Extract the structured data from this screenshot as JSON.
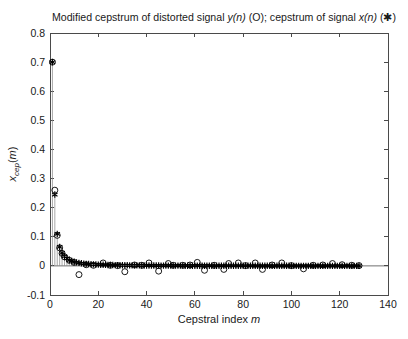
{
  "figure": {
    "background": "#ffffff",
    "axes_color": "#4a4a4a",
    "tick_label_color": "#1a1a1a",
    "marker_color": "#000000",
    "stem_color": "#8a8a8a"
  },
  "chart_data": {
    "type": "scatter",
    "title": "Modified cepstrum of distorted signal y(n) (O); cepstrum of signal x(n) (✱)",
    "title_parts": [
      {
        "text": "Modified cepstrum of distorted signal ",
        "italic": false
      },
      {
        "text": "y(n)",
        "italic": true
      },
      {
        "text": " (O); cepstrum of signal ",
        "italic": false
      },
      {
        "text": "x(n)",
        "italic": true
      },
      {
        "text": " (✱)",
        "italic": false
      }
    ],
    "xlabel": "Cepstral index m",
    "xlabel_parts": [
      {
        "text": "Cepstral index ",
        "italic": false
      },
      {
        "text": "m",
        "italic": true
      }
    ],
    "ylabel": "x_cep(m)",
    "ylabel_parts": [
      {
        "text": "x",
        "italic": true
      },
      {
        "text": "cep",
        "italic": true,
        "sub": true
      },
      {
        "text": "(",
        "italic": false
      },
      {
        "text": "m",
        "italic": true
      },
      {
        "text": ")",
        "italic": false
      }
    ],
    "xlim": [
      0,
      140
    ],
    "ylim": [
      -0.1,
      0.8
    ],
    "xticks": [
      0,
      20,
      40,
      60,
      80,
      100,
      120,
      140
    ],
    "yticks": [
      -0.1,
      0,
      0.1,
      0.2,
      0.3,
      0.4,
      0.5,
      0.6,
      0.7,
      0.8
    ],
    "ytick_labels": [
      "-0.1",
      "0",
      "0.1",
      "0.2",
      "0.3",
      "0.4",
      "0.5",
      "0.6",
      "0.7",
      "0.8"
    ],
    "grid": false,
    "legend_position": "none",
    "series": [
      {
        "name": "cepstrum of signal x(n)",
        "marker": "asterisk",
        "stems": true,
        "m_start": 1,
        "values": [
          0.7,
          0.245,
          0.11,
          0.065,
          0.045,
          0.033,
          0.026,
          0.02,
          0.017,
          0.014,
          0.012,
          0.0102,
          0.0089,
          0.0079,
          0.007,
          0.0063,
          0.0057,
          0.0051,
          0.0047,
          0.0043,
          0.004,
          0.0037,
          0.0034,
          0.0032,
          0.0029,
          0.0028,
          0.0026,
          0.0024,
          0.0023,
          0.0022,
          0.0021,
          0.002,
          0.0019,
          0.0018,
          0.0017,
          0.0016,
          0.0016,
          0.0015,
          0.0014,
          0.0013,
          0.0013,
          0.0012,
          0.0012,
          0.0011,
          0.0011,
          0.001,
          0.001,
          0.001,
          0.0009,
          0.0009,
          0.0009,
          0.0008,
          0.0008,
          0.0008,
          0.0008,
          0.0007,
          0.0007,
          0.0007,
          0.0007,
          0.0007,
          0.0006,
          0.0006,
          0.0006,
          0.0006,
          0.0006,
          0.0005,
          0.0005,
          0.0005,
          0.0005,
          0.0005,
          0.0005,
          0.0005,
          0.0005,
          0.0004,
          0.0004,
          0.0004,
          0.0004,
          0.0004,
          0.0004,
          0.0004,
          0.0004,
          0.0004,
          0.0004,
          0.0003,
          0.0003,
          0.0003,
          0.0003,
          0.0003,
          0.0003,
          0.0003,
          0.0003,
          0.0003,
          0.0003,
          0.0003,
          0.0003,
          0.0003,
          0.0003,
          0.0003,
          0.0003,
          0.0003,
          0.0002,
          0.0002,
          0.0002,
          0.0002,
          0.0002,
          0.0002,
          0.0002,
          0.0002,
          0.0002,
          0.0002,
          0.0002,
          0.0002,
          0.0002,
          0.0002,
          0.0002,
          0.0002,
          0.0002,
          0.0002,
          0.0002,
          0.0002,
          0.0002,
          0.0002,
          0.0002,
          0.0002,
          0.0002,
          0.0002,
          0.0002,
          0.0002
        ]
      },
      {
        "name": "modified cepstrum of distorted signal y(n)",
        "marker": "circle",
        "stems": false,
        "points": [
          [
            1,
            0.7
          ],
          [
            2,
            0.26
          ],
          [
            3,
            0.105
          ],
          [
            4,
            0.062
          ],
          [
            5,
            0.043
          ],
          [
            6,
            0.031
          ],
          [
            8,
            0.019
          ],
          [
            10,
            0.012
          ],
          [
            12,
            -0.03
          ],
          [
            15,
            0.004
          ],
          [
            18,
            0.002
          ],
          [
            22,
            0.01
          ],
          [
            25,
            0.002
          ],
          [
            28,
            0.001
          ],
          [
            31,
            -0.02
          ],
          [
            35,
            0.003
          ],
          [
            38,
            0.002
          ],
          [
            41,
            0.01
          ],
          [
            45,
            -0.018
          ],
          [
            49,
            0.008
          ],
          [
            51,
            0.002
          ],
          [
            55,
            0.002
          ],
          [
            58,
            0.003
          ],
          [
            61,
            0.012
          ],
          [
            64,
            -0.015
          ],
          [
            68,
            0.002
          ],
          [
            72,
            -0.012
          ],
          [
            74,
            0.008
          ],
          [
            78,
            0.01
          ],
          [
            81,
            0.001
          ],
          [
            85,
            0.01
          ],
          [
            88,
            -0.012
          ],
          [
            92,
            0.003
          ],
          [
            96,
            0.01
          ],
          [
            100,
            0.001
          ],
          [
            105,
            -0.01
          ],
          [
            109,
            0.002
          ],
          [
            113,
            0.003
          ],
          [
            117,
            0.008
          ],
          [
            121,
            0.004
          ],
          [
            125,
            0.002
          ],
          [
            128,
            0.001
          ]
        ]
      }
    ]
  }
}
